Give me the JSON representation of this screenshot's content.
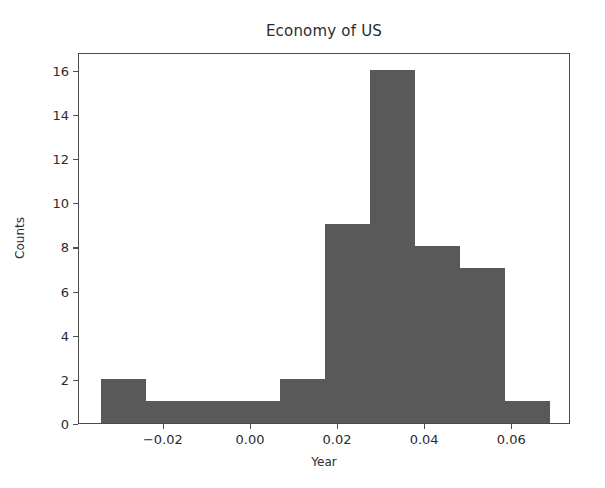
{
  "chart_data": {
    "type": "bar",
    "title": "Economy of US",
    "xlabel": "Year",
    "ylabel": "Counts",
    "grid": false,
    "legend": null,
    "xlim": [
      -0.0395,
      0.0735
    ],
    "ylim": [
      0,
      16.8
    ],
    "bin_width": 0.01031,
    "bin_edges": [
      -0.0345,
      -0.02419,
      -0.01388,
      -0.00357,
      0.00674,
      0.01705,
      0.02736,
      0.03767,
      0.04798,
      0.05829,
      0.0686
    ],
    "categories": [
      "-0.0345 – -0.0242",
      "-0.0242 – -0.0139",
      "-0.0139 – -0.0036",
      "-0.0036 – 0.0067",
      "0.0067 – 0.0171",
      "0.0171 – 0.0274",
      "0.0274 – 0.0377",
      "0.0377 – 0.0480",
      "0.0480 – 0.0583",
      "0.0583 – 0.0686"
    ],
    "values": [
      2,
      1,
      1,
      1,
      2,
      9,
      16,
      8,
      7,
      1
    ],
    "xticks": [
      -0.02,
      0.0,
      0.02,
      0.04,
      0.06
    ],
    "xtick_labels": [
      "−0.02",
      "0.00",
      "0.02",
      "0.04",
      "0.06"
    ],
    "yticks": [
      0,
      2,
      4,
      6,
      8,
      10,
      12,
      14,
      16
    ],
    "ytick_labels": [
      "0",
      "2",
      "4",
      "6",
      "8",
      "10",
      "12",
      "14",
      "16"
    ],
    "bar_color": "#595959",
    "axis_color": "#4a4a4a",
    "text_color": "#2b2b2b",
    "background_color": "#ffffff"
  }
}
